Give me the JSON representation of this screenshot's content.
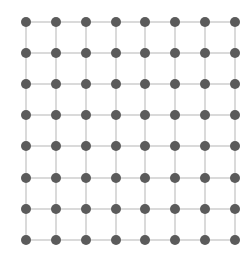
{
  "diagram": {
    "type": "grid-graph",
    "rows": 8,
    "cols": 8,
    "x_positions": [
      26,
      56,
      86,
      116,
      145,
      175,
      205,
      235
    ],
    "y_positions": [
      22,
      53,
      84,
      115,
      146,
      178,
      209,
      240
    ],
    "node_radius": 5,
    "node_color": "#5b5b5b",
    "edge_color": "#c6c6c6",
    "edge_width": 1.3,
    "background": "#ffffff"
  }
}
